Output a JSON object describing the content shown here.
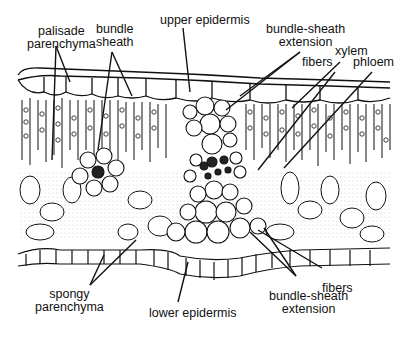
{
  "diagram": {
    "type": "leaf-cross-section",
    "labels": {
      "palisade_parenchyma": {
        "line1": "palisade",
        "line2": "parenchyma"
      },
      "bundle_sheath": {
        "line1": "bundle",
        "line2": "sheath"
      },
      "upper_epidermis": "upper epidermis",
      "bundle_sheath_extension_top": {
        "line1": "bundle-sheath",
        "line2": "extension"
      },
      "xylem": "xylem",
      "fibers_top": "fibers",
      "phloem": "phloem",
      "fibers_bottom": "fibers",
      "spongy_parenchyma": {
        "line1": "spongy",
        "line2": "parenchyma"
      },
      "lower_epidermis": "lower epidermis",
      "bundle_sheath_extension_bottom": {
        "line1": "bundle-sheath",
        "line2": "extension"
      }
    },
    "colors": {
      "ink": "#111111",
      "background": "#ffffff",
      "stipple": "#bdbdbd"
    }
  }
}
